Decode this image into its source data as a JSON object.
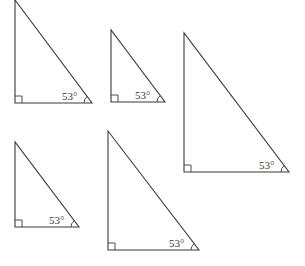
{
  "diagram": {
    "stroke_color": "#3a3a3a",
    "background": "#ffffff",
    "triangles": [
      {
        "id": "t1",
        "top": [
          15,
          0
        ],
        "corner": [
          15,
          103
        ],
        "right": [
          92,
          103
        ],
        "angle_label": "53°",
        "right_angle_marker": true
      },
      {
        "id": "t2",
        "top": [
          111,
          30
        ],
        "corner": [
          111,
          102
        ],
        "right": [
          165,
          102
        ],
        "angle_label": "53°",
        "right_angle_marker": true
      },
      {
        "id": "t3",
        "top": [
          184,
          33
        ],
        "corner": [
          184,
          172
        ],
        "right": [
          289,
          172
        ],
        "angle_label": "53°",
        "right_angle_marker": true
      },
      {
        "id": "t4",
        "top": [
          15,
          142
        ],
        "corner": [
          15,
          227
        ],
        "right": [
          79,
          227
        ],
        "angle_label": "53°",
        "right_angle_marker": true
      },
      {
        "id": "t5",
        "top": [
          108,
          131
        ],
        "corner": [
          108,
          250
        ],
        "right": [
          199,
          250
        ],
        "angle_label": "53°",
        "right_angle_marker": true
      }
    ]
  }
}
